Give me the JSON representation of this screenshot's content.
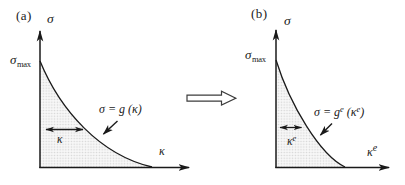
{
  "figure": {
    "background": "#ffffff",
    "ink_color": "#1a1a1a",
    "shade_dot_color": "#d4d4d4",
    "shade_bg_color": "#f7f7f7",
    "panel_a": {
      "tag": "(a)",
      "y_axis_label": "σ",
      "peak_label": {
        "base": "σ",
        "sub": "max"
      },
      "equation": "σ = g (κ)",
      "range_label": "κ",
      "x_axis_label": "κ"
    },
    "panel_b": {
      "tag": "(b)",
      "y_axis_label": "σ",
      "peak_label": {
        "base": "σ",
        "sub": "max"
      },
      "equation": {
        "pre": "σ = g",
        "sup1": "e",
        "mid": " (κ",
        "sup2": "e",
        "post": ")"
      },
      "range_label": {
        "base": "κ",
        "sup": "e"
      },
      "x_axis_label": {
        "base": "κ",
        "sup": "e"
      }
    }
  }
}
